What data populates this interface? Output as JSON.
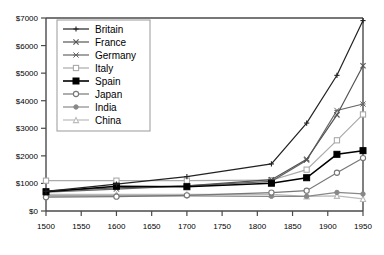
{
  "chart_data": {
    "type": "line",
    "title": "",
    "subtitle": "",
    "xlabel": "",
    "ylabel": "",
    "xlim": [
      1500,
      1950
    ],
    "ylim": [
      0,
      7000
    ],
    "grid": false,
    "legend_position": "top-left",
    "x": [
      1500,
      1600,
      1700,
      1820,
      1870,
      1913,
      1950
    ],
    "xticks": [
      1500,
      1550,
      1600,
      1650,
      1700,
      1750,
      1800,
      1850,
      1900,
      1950
    ],
    "xticklabels": [
      "1500",
      "1550",
      "1600",
      "1650",
      "1700",
      "1750",
      "1800",
      "1850",
      "1900",
      "1950"
    ],
    "yticks": [
      0,
      1000,
      2000,
      3000,
      4000,
      5000,
      6000,
      7000
    ],
    "yticklabels": [
      "$0",
      "$1000",
      "$2000",
      "$3000",
      "$4000",
      "$5000",
      "$6000",
      "$7000"
    ],
    "series": [
      {
        "name": "Britain",
        "marker": "plus",
        "color": "#222222",
        "values": [
          714,
          974,
          1250,
          1707,
          3190,
          4921,
          6907
        ]
      },
      {
        "name": "France",
        "marker": "cross",
        "color": "#555555",
        "values": [
          727,
          841,
          910,
          1135,
          1876,
          3485,
          5271
        ]
      },
      {
        "name": "Germany",
        "marker": "star",
        "color": "#666666",
        "values": [
          688,
          791,
          910,
          1077,
          1839,
          3648,
          3881
        ]
      },
      {
        "name": "Italy",
        "marker": "square-open",
        "color": "#aaaaaa",
        "values": [
          1100,
          1100,
          1100,
          1117,
          1499,
          2564,
          3502
        ]
      },
      {
        "name": "Spain",
        "marker": "square-filled",
        "color": "#000000",
        "values": [
          698,
          900,
          880,
          1008,
          1207,
          2056,
          2189
        ]
      },
      {
        "name": "Japan",
        "marker": "circle-open",
        "color": "#777777",
        "values": [
          500,
          520,
          570,
          669,
          737,
          1387,
          1921
        ]
      },
      {
        "name": "India",
        "marker": "circle-filled",
        "color": "#888888",
        "values": [
          550,
          550,
          550,
          533,
          533,
          673,
          619
        ]
      },
      {
        "name": "China",
        "marker": "triangle-open",
        "color": "#bbbbbb",
        "values": [
          600,
          600,
          600,
          600,
          530,
          552,
          439
        ]
      }
    ]
  },
  "legend": {
    "items": [
      {
        "label": "Britain"
      },
      {
        "label": "France"
      },
      {
        "label": "Germany"
      },
      {
        "label": "Italy"
      },
      {
        "label": "Spain"
      },
      {
        "label": "Japan"
      },
      {
        "label": "India"
      },
      {
        "label": "China"
      }
    ]
  },
  "axes": {
    "frame_color": "#4a4a4a",
    "background": "#ffffff"
  }
}
